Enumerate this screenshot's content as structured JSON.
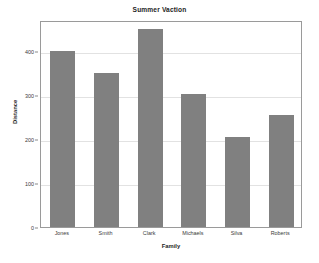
{
  "chart_data": {
    "type": "bar",
    "title": "Summer Vaction",
    "xlabel": "Family",
    "ylabel": "Distance",
    "categories": [
      "Jones",
      "Smith",
      "Clark",
      "Michaels",
      "Silva",
      "Roberts"
    ],
    "values": [
      400,
      350,
      450,
      303,
      205,
      255
    ],
    "ylim": [
      0,
      470
    ],
    "yticks": [
      0,
      100,
      200,
      300,
      400
    ],
    "ytick_labels": [
      "0",
      "100",
      "200",
      "300",
      "400"
    ],
    "grid": true,
    "legend": false,
    "bar_color": "#808080",
    "plot_background": "#ffffff",
    "axis_color": "#9a9a9a",
    "gridline_color": "#e2e2e2"
  }
}
